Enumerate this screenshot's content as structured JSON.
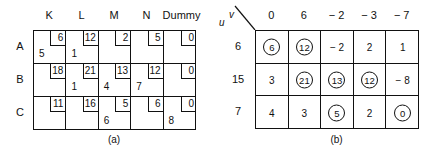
{
  "table_a": {
    "caption": "(a)",
    "columns": [
      "K",
      "L",
      "M",
      "N",
      "Dummy"
    ],
    "rows": [
      {
        "label": "A",
        "cells": [
          {
            "cost": "6",
            "alloc": "5"
          },
          {
            "cost": "12",
            "alloc": "1"
          },
          {
            "cost": "2",
            "alloc": ""
          },
          {
            "cost": "5",
            "alloc": ""
          },
          {
            "cost": "0",
            "alloc": ""
          }
        ]
      },
      {
        "label": "B",
        "cells": [
          {
            "cost": "18",
            "alloc": ""
          },
          {
            "cost": "21",
            "alloc": "1"
          },
          {
            "cost": "13",
            "alloc": "4"
          },
          {
            "cost": "12",
            "alloc": "7"
          },
          {
            "cost": "0",
            "alloc": ""
          }
        ]
      },
      {
        "label": "C",
        "cells": [
          {
            "cost": "11",
            "alloc": ""
          },
          {
            "cost": "16",
            "alloc": ""
          },
          {
            "cost": "5",
            "alloc": "6"
          },
          {
            "cost": "6",
            "alloc": ""
          },
          {
            "cost": "0",
            "alloc": "8"
          }
        ]
      }
    ]
  },
  "table_b": {
    "caption": "(b)",
    "corner_u": "u",
    "corner_v": "v",
    "v_values": [
      "0",
      "6",
      "− 2",
      "− 3",
      "− 7"
    ],
    "rows": [
      {
        "u": "6",
        "cells": [
          {
            "value": "6",
            "circled": true
          },
          {
            "value": "12",
            "circled": true
          },
          {
            "value": "− 2",
            "circled": false
          },
          {
            "value": "2",
            "circled": false
          },
          {
            "value": "1",
            "circled": false
          }
        ]
      },
      {
        "u": "15",
        "cells": [
          {
            "value": "3",
            "circled": false
          },
          {
            "value": "21",
            "circled": true
          },
          {
            "value": "13",
            "circled": true
          },
          {
            "value": "12",
            "circled": true
          },
          {
            "value": "− 8",
            "circled": false
          }
        ]
      },
      {
        "u": "7",
        "cells": [
          {
            "value": "4",
            "circled": false
          },
          {
            "value": "3",
            "circled": false
          },
          {
            "value": "5",
            "circled": true
          },
          {
            "value": "2",
            "circled": false
          },
          {
            "value": "0",
            "circled": true
          }
        ]
      }
    ]
  }
}
